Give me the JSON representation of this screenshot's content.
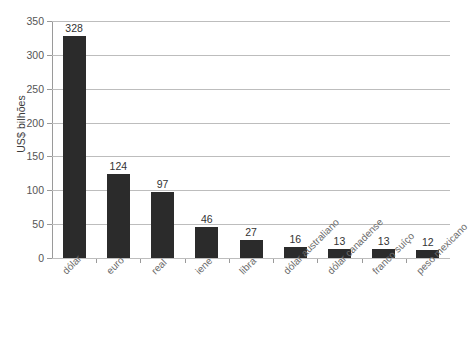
{
  "chart_data": {
    "type": "bar",
    "title": "",
    "subtitle": "",
    "xlabel": "",
    "ylabel": "US$ bilhões",
    "ylim": [
      0,
      350
    ],
    "ytick_step": 50,
    "yticks": [
      "350",
      "300",
      "250",
      "200",
      "150",
      "100",
      "50",
      "0"
    ],
    "grid": true,
    "legend": false,
    "legend_position": "none",
    "bar_color": "#2b2b2b",
    "gridline_color": "#bdbdbd",
    "axis_color": "#9a9a9a",
    "categories": [
      "dólar",
      "euro",
      "real",
      "iene",
      "libra",
      "dólar australiano",
      "dólar canadense",
      "franco suíço",
      "peso mexicano"
    ],
    "values": [
      328,
      124,
      97,
      46,
      27,
      16,
      13,
      13,
      12
    ],
    "value_labels": [
      "328",
      "124",
      "97",
      "46",
      "27",
      "16",
      "13",
      "13",
      "12"
    ]
  }
}
